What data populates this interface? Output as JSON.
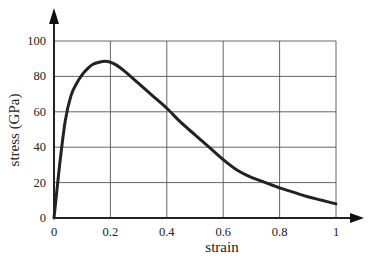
{
  "chart_data": {
    "type": "line",
    "title": "",
    "xlabel": "strain",
    "ylabel": "stress (GPa)",
    "xlim": [
      0,
      1
    ],
    "ylim": [
      0,
      100
    ],
    "grid": true,
    "legend": null,
    "x_ticks": [
      "0",
      "0.2",
      "0.4",
      "0.6",
      "0.8",
      "1"
    ],
    "y_ticks": [
      "0",
      "20",
      "40",
      "60",
      "80",
      "100"
    ],
    "series": [
      {
        "name": "stress-strain curve",
        "color": "#222222",
        "x": [
          0,
          0.02,
          0.04,
          0.06,
          0.08,
          0.1,
          0.12,
          0.14,
          0.16,
          0.18,
          0.2,
          0.22,
          0.25,
          0.3,
          0.35,
          0.4,
          0.45,
          0.5,
          0.55,
          0.6,
          0.65,
          0.7,
          0.75,
          0.8,
          0.85,
          0.9,
          0.95,
          1.0
        ],
        "y": [
          0,
          30,
          55,
          69,
          76,
          81,
          84.5,
          87,
          88,
          88.5,
          88,
          86.5,
          83,
          76,
          69,
          62,
          54,
          47,
          40,
          33,
          27,
          23,
          20,
          17,
          14.5,
          12,
          10,
          8
        ]
      }
    ]
  }
}
